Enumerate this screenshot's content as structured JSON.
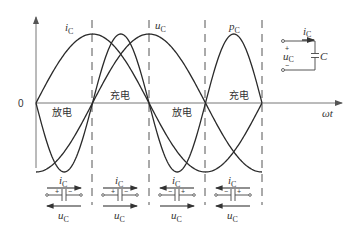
{
  "figure": {
    "origin_label": "0",
    "x_axis_label": "ωt",
    "curve_labels": {
      "i": {
        "main": "i",
        "sub": "C"
      },
      "u": {
        "main": "u",
        "sub": "C"
      },
      "p": {
        "main": "p",
        "sub": "C"
      }
    },
    "regions": [
      {
        "label": "放电",
        "side": "below"
      },
      {
        "label": "充电",
        "side": "above"
      },
      {
        "label": "放电",
        "side": "below"
      },
      {
        "label": "充电",
        "side": "above"
      }
    ],
    "inset_circuit": {
      "current_label": {
        "main": "i",
        "sub": "C"
      },
      "voltage_label": {
        "main": "u",
        "sub": "C"
      },
      "plus": "+",
      "minus": "−",
      "capacitor_label": "C"
    },
    "capacitor_states": [
      {
        "i_label": {
          "main": "i",
          "sub": "C"
        },
        "i_dir": "right",
        "u_label": {
          "main": "u",
          "sub": "C"
        },
        "u_dir": "left",
        "left_sign": "+",
        "right_sign": "−"
      },
      {
        "i_label": {
          "main": "i",
          "sub": "C"
        },
        "i_dir": "right",
        "u_label": {
          "main": "u",
          "sub": "C"
        },
        "u_dir": "right",
        "left_sign": "+",
        "right_sign": "−"
      },
      {
        "i_label": {
          "main": "i",
          "sub": "C"
        },
        "i_dir": "left",
        "u_label": {
          "main": "u",
          "sub": "C"
        },
        "u_dir": "right",
        "left_sign": "−",
        "right_sign": "+"
      },
      {
        "i_label": {
          "main": "i",
          "sub": "C"
        },
        "i_dir": "left",
        "u_label": {
          "main": "u",
          "sub": "C"
        },
        "u_dir": "left",
        "left_sign": "−",
        "right_sign": "+"
      }
    ]
  }
}
